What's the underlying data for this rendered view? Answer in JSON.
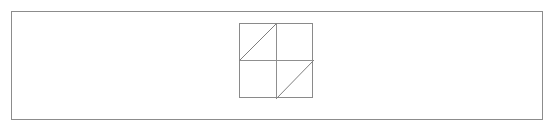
{
  "page": {
    "background_color": "#ffffff",
    "width": 554,
    "height": 130
  },
  "figure": {
    "name": "half-square-triangle-pinwheel-diagram",
    "outer_rectangle": {
      "label": "outer-frame",
      "x": 11,
      "y": 11,
      "width": 532,
      "height": 109,
      "stroke_color": "#8c8c8c",
      "stroke_width": 1.1,
      "fill": "none"
    },
    "inner_square": {
      "label": "inner-square",
      "x": 239,
      "y": 23,
      "width": 74,
      "height": 75,
      "stroke_color": "#8a8a8a",
      "stroke_width": 1.1,
      "fill": "none"
    },
    "center_point": {
      "x": 276,
      "y": 60.5
    },
    "cross_lines": [
      {
        "label": "horizontal-midline",
        "x1": 239,
        "y1": 60.5,
        "x2": 313,
        "y2": 60.5,
        "stroke_color": "#8f8f8f",
        "stroke_width": 1
      },
      {
        "label": "vertical-midline",
        "x1": 276,
        "y1": 23,
        "x2": 276,
        "y2": 98,
        "stroke_color": "#8f8f8f",
        "stroke_width": 1
      }
    ],
    "diagonals": [
      {
        "label": "top-left-quadrant-diagonal",
        "quadrant": "top-left",
        "x1": 239,
        "y1": 60.5,
        "x2": 276,
        "y2": 23,
        "direction": "bottom-left-to-top-right",
        "stroke_color": "#7e7e7e",
        "stroke_width": 1
      },
      {
        "label": "bottom-right-quadrant-diagonal",
        "quadrant": "bottom-right",
        "x1": 276,
        "y1": 98,
        "x2": 313,
        "y2": 60.5,
        "direction": "bottom-left-to-top-right",
        "stroke_color": "#7e7e7e",
        "stroke_width": 1
      }
    ],
    "empty_quadrants": [
      "top-right",
      "bottom-left"
    ]
  }
}
